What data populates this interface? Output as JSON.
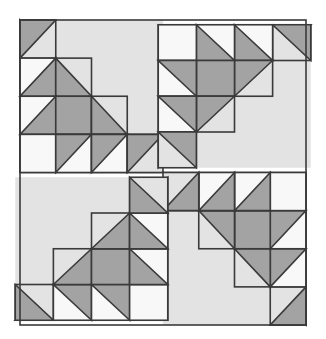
{
  "meta": {
    "canvas_width": 326,
    "canvas_height": 339
  },
  "palette": {
    "background": "#ffffff",
    "white_patch": "#f8f8f8",
    "light_gray": "#e3e3e3",
    "medium_gray": "#a3a3a3",
    "outline": "#3a3a3a",
    "outline_width": 1.6
  },
  "block": {
    "x": 20,
    "y": 20,
    "width": 286,
    "height": 305,
    "center_x": 163,
    "center_y": 172.5,
    "quadrant_cols": 4,
    "quadrant_rows": 4,
    "cell_width": 35.75,
    "cell_height": 38.125
  },
  "quadrants": [
    {
      "name": "top-left",
      "rotation": 0,
      "origin_x": 20,
      "origin_y": 20,
      "large_triangle": "lower-left",
      "large_triangle_fill": "medium_gray",
      "field_fill": "light_gray"
    },
    {
      "name": "top-right",
      "rotation": 90,
      "origin_x": 163,
      "origin_y": 20,
      "large_triangle": "upper-left",
      "large_triangle_fill": "medium_gray",
      "field_fill": "light_gray"
    },
    {
      "name": "bottom-right",
      "rotation": 180,
      "origin_x": 163,
      "origin_y": 172.5,
      "large_triangle": "upper-right",
      "large_triangle_fill": "medium_gray",
      "field_fill": "light_gray"
    },
    {
      "name": "bottom-left",
      "rotation": 270,
      "origin_x": 20,
      "origin_y": 172.5,
      "large_triangle": "lower-right",
      "large_triangle_fill": "medium_gray",
      "field_fill": "light_gray"
    }
  ],
  "unit_cells": {
    "note": "Within each quadrant's local 4x4 grid (col 0-3 left-to-right, row 0-3 top-to-bottom), the patch layout repeated by rotation.",
    "legend": {
      "L": "light_gray field",
      "W": "white_patch",
      "M": "medium_gray",
      "hst": "half-square triangle",
      "big": "part of the large quadrant triangle"
    },
    "layout": [
      {
        "row": 0,
        "col": 0,
        "type": "hst",
        "dark_corner": "top-left",
        "dark": "medium_gray",
        "light": "light_gray"
      },
      {
        "row": 0,
        "col": 1,
        "type": "big",
        "fill": "light_gray"
      },
      {
        "row": 0,
        "col": 2,
        "type": "big",
        "fill": "light_gray"
      },
      {
        "row": 0,
        "col": 3,
        "type": "big",
        "fill": "light_gray"
      },
      {
        "row": 1,
        "col": 0,
        "type": "hst",
        "dark_corner": "bottom-right",
        "dark": "medium_gray",
        "light": "white_patch"
      },
      {
        "row": 1,
        "col": 1,
        "type": "hst",
        "dark_corner": "bottom-left",
        "dark": "medium_gray",
        "light": "light_gray"
      },
      {
        "row": 1,
        "col": 2,
        "type": "big",
        "fill": "light_gray"
      },
      {
        "row": 1,
        "col": 3,
        "type": "big",
        "fill": "light_gray"
      },
      {
        "row": 2,
        "col": 0,
        "type": "hst",
        "dark_corner": "bottom-right",
        "dark": "medium_gray",
        "light": "white_patch"
      },
      {
        "row": 2,
        "col": 1,
        "type": "solid",
        "fill": "medium_gray"
      },
      {
        "row": 2,
        "col": 2,
        "type": "hst",
        "dark_corner": "bottom-left",
        "dark": "medium_gray",
        "light": "light_gray"
      },
      {
        "row": 2,
        "col": 3,
        "type": "big",
        "fill": "light_gray"
      },
      {
        "row": 3,
        "col": 0,
        "type": "solid",
        "fill": "white_patch"
      },
      {
        "row": 3,
        "col": 1,
        "type": "hst",
        "dark_corner": "top-left",
        "dark": "medium_gray",
        "light": "white_patch"
      },
      {
        "row": 3,
        "col": 2,
        "type": "hst",
        "dark_corner": "top-left",
        "dark": "medium_gray",
        "light": "white_patch"
      },
      {
        "row": 3,
        "col": 3,
        "type": "hst",
        "dark_corner": "top-left",
        "dark": "medium_gray",
        "light": "light_gray"
      }
    ]
  }
}
